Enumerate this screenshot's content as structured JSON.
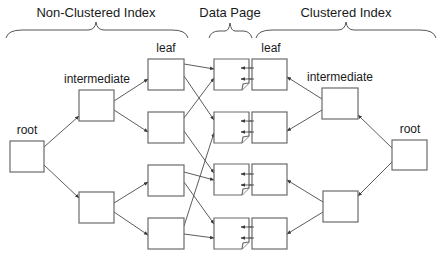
{
  "headers": {
    "nonclustered": "Non-Clustered Index",
    "datapage": "Data Page",
    "clustered": "Clustered Index"
  },
  "labels": {
    "left_root": "root",
    "left_intermediate": "intermediate",
    "left_leaf": "leaf",
    "right_leaf": "leaf",
    "right_intermediate": "intermediate",
    "right_root": "root"
  },
  "colors": {
    "box_stroke": "#6b6b6b",
    "edge": "#4a4a4a",
    "text": "#1a1a1a",
    "background": "#ffffff"
  },
  "nodes": {
    "left_root": {
      "x": 10,
      "y": 141,
      "w": 34,
      "h": 31
    },
    "left_intermediate": [
      {
        "x": 79,
        "y": 90,
        "w": 35,
        "h": 31
      },
      {
        "x": 79,
        "y": 192,
        "w": 35,
        "h": 31
      }
    ],
    "left_leaf": [
      {
        "x": 148,
        "y": 59,
        "w": 36,
        "h": 31
      },
      {
        "x": 148,
        "y": 112,
        "w": 36,
        "h": 31
      },
      {
        "x": 148,
        "y": 165,
        "w": 36,
        "h": 31
      },
      {
        "x": 148,
        "y": 218,
        "w": 36,
        "h": 31
      }
    ],
    "data_page": [
      {
        "x": 214,
        "y": 59,
        "w": 35,
        "h": 31
      },
      {
        "x": 214,
        "y": 112,
        "w": 35,
        "h": 31
      },
      {
        "x": 214,
        "y": 164,
        "w": 35,
        "h": 31
      },
      {
        "x": 214,
        "y": 218,
        "w": 35,
        "h": 31
      }
    ],
    "right_leaf": [
      {
        "x": 252,
        "y": 59,
        "w": 35,
        "h": 31
      },
      {
        "x": 252,
        "y": 112,
        "w": 35,
        "h": 31
      },
      {
        "x": 252,
        "y": 164,
        "w": 35,
        "h": 31
      },
      {
        "x": 252,
        "y": 218,
        "w": 35,
        "h": 31
      }
    ],
    "right_intermediate": [
      {
        "x": 322,
        "y": 88,
        "w": 36,
        "h": 31
      },
      {
        "x": 323,
        "y": 191,
        "w": 35,
        "h": 31
      }
    ],
    "right_root": {
      "x": 392,
      "y": 140,
      "w": 35,
      "h": 30
    }
  }
}
